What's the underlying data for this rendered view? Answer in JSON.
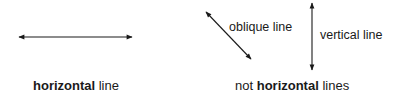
{
  "diagram": {
    "horizontal": {
      "caption_bold": "horizontal",
      "caption_rest": " line"
    },
    "not_horizontal": {
      "caption_prefix": "not ",
      "caption_bold": "horizontal",
      "caption_rest": " lines",
      "oblique_label": "oblique line",
      "vertical_label": "vertical line"
    },
    "line_color": "#1a1a1a"
  }
}
